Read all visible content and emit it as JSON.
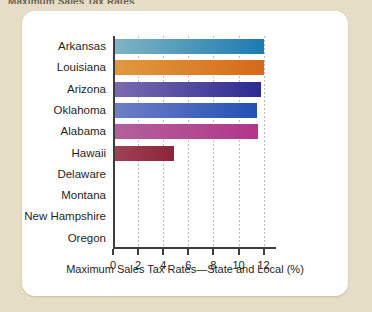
{
  "figure": {
    "title": "Maximum Sales Tax Rates"
  },
  "chart_data": {
    "type": "bar",
    "orientation": "horizontal",
    "title": "Maximum Sales Tax Rates",
    "xlabel": "Maximum Sales Tax Rates—State and Local (%)",
    "ylabel": "",
    "xlim": [
      0,
      12
    ],
    "xticks": [
      0,
      2,
      4,
      6,
      8,
      10,
      12
    ],
    "xticklabels": [
      "0",
      "2",
      "4",
      "6",
      "8",
      "10",
      "12"
    ],
    "grid": "vertical-dotted",
    "legend": "none",
    "categories": [
      "Arkansas",
      "Louisiana",
      "Arizona",
      "Oklahoma",
      "Alabama",
      "Hawaii",
      "Delaware",
      "Montana",
      "New Hampshire",
      "Oregon"
    ],
    "values": [
      11.9,
      11.85,
      11.6,
      11.3,
      11.4,
      4.7,
      0,
      0,
      0,
      0
    ],
    "bar_colors_left": [
      "#7fb4c4",
      "#e09a3e",
      "#7b6cb0",
      "#6f7fc6",
      "#b3619a",
      "#9e4358",
      "#ffffff",
      "#ffffff",
      "#ffffff",
      "#ffffff"
    ],
    "bar_colors_right": [
      "#1d7bb0",
      "#d6691a",
      "#2b2a90",
      "#2350b4",
      "#b2368a",
      "#8e2437",
      "#ffffff",
      "#ffffff",
      "#ffffff",
      "#ffffff"
    ]
  },
  "colors": {
    "page_background": "#e6ddc6",
    "card_background": "#ffffff",
    "axis": "#3d3d41",
    "gridline": "#b9bcc4",
    "text": "#1f1f23"
  }
}
